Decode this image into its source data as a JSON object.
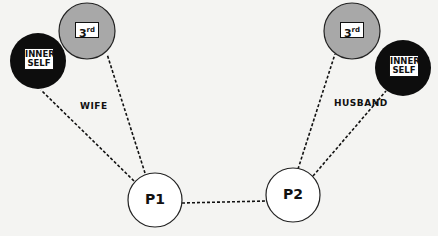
{
  "diagram": {
    "labels": {
      "wife": "WIFE",
      "husband": "HUSBAND"
    },
    "nodes": {
      "p1": {
        "label": "P1",
        "fill": "#ffffff"
      },
      "p2": {
        "label": "P2",
        "fill": "#ffffff"
      },
      "left_inner": {
        "line1": "INNER",
        "line2": "SELF",
        "fill": "#0d0d0d"
      },
      "right_inner": {
        "line1": "INNER",
        "line2": "SELF",
        "fill": "#0d0d0d"
      },
      "left_third": {
        "label": "3",
        "sup": "rd",
        "fill": "#a8a8a8"
      },
      "right_third": {
        "label": "3",
        "sup": "rd",
        "fill": "#a8a8a8"
      }
    },
    "edges": [
      {
        "from": "p1",
        "to": "p2",
        "style": "dashed"
      },
      {
        "from": "p1",
        "to": "left_inner",
        "style": "dashed"
      },
      {
        "from": "p1",
        "to": "left_third",
        "style": "dashed"
      },
      {
        "from": "p2",
        "to": "right_inner",
        "style": "dashed"
      },
      {
        "from": "p2",
        "to": "right_third",
        "style": "dashed"
      }
    ]
  }
}
